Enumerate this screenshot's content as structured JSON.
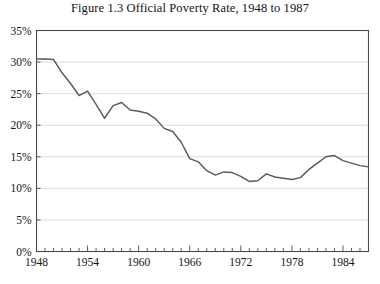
{
  "chart_data": {
    "type": "line",
    "title": "Figure 1.3   Official Poverty Rate, 1948 to 1987",
    "xlabel": "",
    "ylabel": "",
    "xlim": [
      1948,
      1987
    ],
    "ylim": [
      0,
      35
    ],
    "grid": true,
    "legend": false,
    "y_tick_labels": [
      "0%",
      "5%",
      "10%",
      "15%",
      "20%",
      "25%",
      "30%",
      "35%"
    ],
    "y_tick_values": [
      0,
      5,
      10,
      15,
      20,
      25,
      30,
      35
    ],
    "x_tick_labels": [
      "1948",
      "1954",
      "1960",
      "1966",
      "1972",
      "1978",
      "1984"
    ],
    "x_tick_values": [
      1948,
      1954,
      1960,
      1966,
      1972,
      1978,
      1984
    ],
    "x_minor_step": 1,
    "series": [
      {
        "name": "Official Poverty Rate",
        "color": "#5a5a5a",
        "x": [
          1948,
          1949,
          1950,
          1951,
          1952,
          1953,
          1954,
          1955,
          1956,
          1957,
          1958,
          1959,
          1960,
          1961,
          1962,
          1963,
          1964,
          1965,
          1966,
          1967,
          1968,
          1969,
          1970,
          1971,
          1972,
          1973,
          1974,
          1975,
          1976,
          1977,
          1978,
          1979,
          1980,
          1981,
          1982,
          1983,
          1984,
          1985,
          1986,
          1987
        ],
        "values": [
          30.5,
          30.5,
          30.4,
          28.3,
          26.6,
          24.7,
          25.4,
          23.3,
          21.1,
          23.1,
          23.6,
          22.4,
          22.2,
          21.9,
          21.0,
          19.5,
          19.0,
          17.3,
          14.7,
          14.2,
          12.8,
          12.1,
          12.6,
          12.5,
          11.9,
          11.1,
          11.2,
          12.3,
          11.8,
          11.6,
          11.4,
          11.7,
          13.0,
          14.0,
          15.0,
          15.2,
          14.4,
          14.0,
          13.6,
          13.4
        ]
      }
    ]
  },
  "axes": {
    "y_axis_name": "poverty-rate-percent",
    "x_axis_name": "year"
  }
}
